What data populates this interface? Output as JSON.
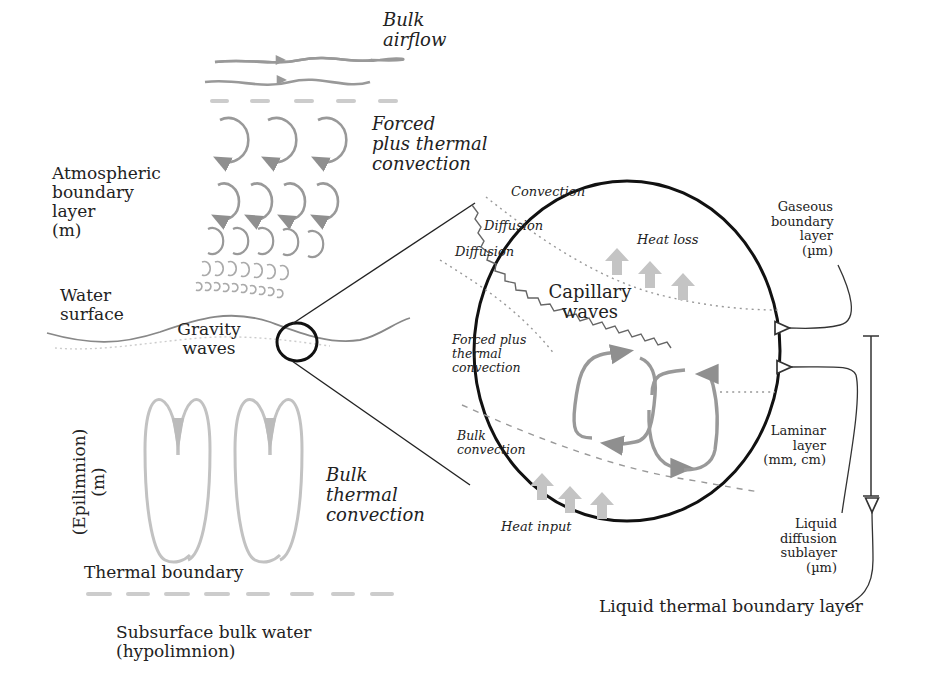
{
  "labels": {
    "bulk_airflow": "Bulk\nairflow",
    "forced_thermal_convection_air": "Forced\nplus thermal\nconvection",
    "atmospheric_boundary_layer": "Atmospheric\nboundary\nlayer\n(m)",
    "water_surface": "Water\nsurface",
    "gravity_waves": "Gravity\nwaves",
    "epilimnion": "(Epilimnion)\n(m)",
    "bulk_thermal_convection": "Bulk\nthermal\nconvection",
    "thermal_boundary": "Thermal boundary",
    "subsurface_bulk_water": "Subsurface bulk water\n(hypolimnion)"
  },
  "inset": {
    "convection": "Convection",
    "diffusion_upper": "Diffusion",
    "diffusion_lower": "Diffusion",
    "heat_loss": "Heat loss",
    "capillary_waves": "Capillary\nwaves",
    "forced_plus_thermal_convection": "Forced plus\nthermal\nconvection",
    "bulk_convection": "Bulk\nconvection",
    "heat_input": "Heat input"
  },
  "right_annotations": {
    "gaseous_boundary_layer": "Gaseous\nboundary\nlayer\n(µm)",
    "laminar_layer": "Laminar\nlayer\n(mm, cm)",
    "liquid_diffusion_sublayer": "Liquid\ndiffusion\nsublayer\n(µm)",
    "liquid_thermal_boundary_layer": "Liquid thermal boundary layer"
  },
  "colors": {
    "ink": "#222222",
    "flow_gray": "#9a9a9a",
    "light_gray": "#bdbdbd",
    "heat_arrow": "#b8b8b8"
  }
}
